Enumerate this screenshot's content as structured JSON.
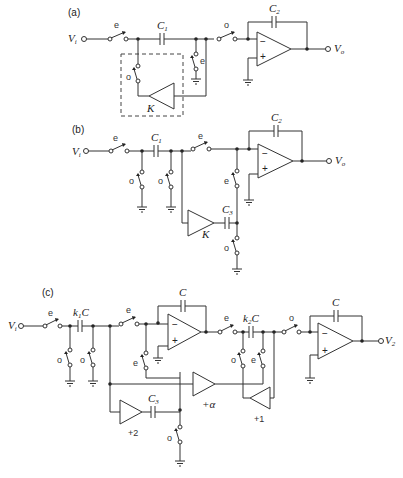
{
  "figure": {
    "panels": [
      {
        "id": "a",
        "label": "(a)",
        "input": "V",
        "input_sub": "i",
        "output": "V",
        "output_sub": "o",
        "capacitors": [
          {
            "name": "C",
            "sub": "1"
          },
          {
            "name": "C",
            "sub": "2"
          }
        ],
        "switches": {
          "series_in": "e",
          "shunt_left": "o",
          "shunt_right": "e",
          "series_out": "o"
        },
        "amplifier": {
          "gain": "K"
        },
        "opamp": {
          "minus": "−",
          "plus": "+"
        }
      },
      {
        "id": "b",
        "label": "(b)",
        "input": "V",
        "input_sub": "i",
        "output": "V",
        "output_sub": "o",
        "capacitors": [
          {
            "name": "C",
            "sub": "1"
          },
          {
            "name": "C",
            "sub": "2"
          },
          {
            "name": "C",
            "sub": "3"
          }
        ],
        "switches": {
          "series_in": "e",
          "shunt_1": "o",
          "shunt_2": "o",
          "series_out": "e",
          "shunt_3": "e",
          "shunt_4": "o"
        },
        "amplifier": {
          "gain": "K"
        },
        "opamp": {
          "minus": "−",
          "plus": "+"
        }
      },
      {
        "id": "c",
        "label": "(c)",
        "input": "V",
        "input_sub": "i",
        "output": "V",
        "output_sub": "2",
        "capacitors": [
          {
            "name": "k",
            "sub": "1",
            "suffix": "C"
          },
          {
            "name": "C",
            "sub": ""
          },
          {
            "name": "k",
            "sub": "2",
            "suffix": "C"
          },
          {
            "name": "C",
            "sub": ""
          },
          {
            "name": "C",
            "sub": "3"
          }
        ],
        "switches": {
          "s1": "e",
          "s2": "o",
          "s3": "o",
          "s4": "e",
          "s5": "e",
          "s6": "e",
          "s7": "o",
          "s8": "e",
          "s9": "o",
          "s10": "o"
        },
        "amplifiers": [
          {
            "gain": "+2"
          },
          {
            "gain": "+α"
          },
          {
            "gain": "+1"
          }
        ],
        "opamp": {
          "minus": "−",
          "plus": "+"
        }
      }
    ]
  }
}
